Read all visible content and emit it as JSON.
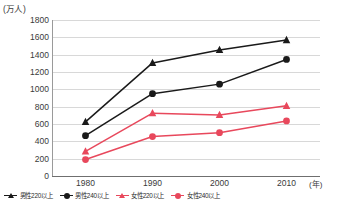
{
  "chart_data": {
    "type": "line",
    "title": "",
    "subtitle": "",
    "xlabel": "年",
    "ylabel": "万人",
    "y_unit_label": "(万人)",
    "x_unit_label": "(年)",
    "categories": [
      "1980",
      "1990",
      "2000",
      "2010"
    ],
    "x": [
      1980,
      1990,
      2000,
      2010
    ],
    "ylim": [
      0,
      1800
    ],
    "ytick_step": 200,
    "yticks": [
      "0",
      "200",
      "400",
      "600",
      "800",
      "1000",
      "1200",
      "1400",
      "1600",
      "1800"
    ],
    "grid": true,
    "legend_position": "bottom",
    "series": [
      {
        "name": "男性220以上",
        "color": "#1a1a1a",
        "marker": "triangle",
        "values": [
          625,
          1305,
          1455,
          1570
        ]
      },
      {
        "name": "男性240以上",
        "color": "#1a1a1a",
        "marker": "circle",
        "values": [
          465,
          950,
          1060,
          1345
        ]
      },
      {
        "name": "女性220以上",
        "color": "#e8485c",
        "marker": "triangle",
        "values": [
          285,
          725,
          705,
          810
        ]
      },
      {
        "name": "女性240以上",
        "color": "#e8485c",
        "marker": "circle",
        "values": [
          190,
          455,
          500,
          635
        ]
      }
    ]
  },
  "colors": {
    "male": "#1a1a1a",
    "female": "#e8485c",
    "grid": "#d8d8d8",
    "axis": "#6f6f6f",
    "background": "#ffffff"
  }
}
